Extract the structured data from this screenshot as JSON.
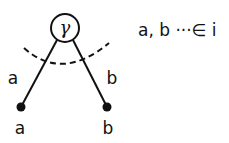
{
  "diagram": {
    "vertex": {
      "label": "γ",
      "cx": 65,
      "cy": 28,
      "r": 14
    },
    "edges": [
      {
        "id": "left",
        "label": "a",
        "end_label": "a"
      },
      {
        "id": "right",
        "label": "b",
        "end_label": "b"
      }
    ],
    "cut": {
      "style": "dashed"
    },
    "annotation": "a, b ···∈ i",
    "colors": {
      "ink": "#111111",
      "background": "#ffffff"
    }
  }
}
